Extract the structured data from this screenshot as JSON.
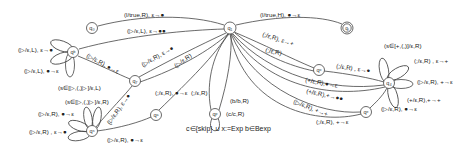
{
  "diagram": {
    "type": "pushdown-automaton",
    "states": [
      {
        "id": "q0",
        "label": "q₀",
        "x": 92,
        "y": 28
      },
      {
        "id": "q1",
        "label": "q₁",
        "x": 230,
        "y": 28
      },
      {
        "id": "qf",
        "label": "q_f",
        "x": 347,
        "y": 28,
        "accepting": true
      },
      {
        "id": "qb",
        "label": "q_b",
        "x": 73,
        "y": 52
      },
      {
        "id": "q7",
        "label": "q₇",
        "x": 135,
        "y": 81
      },
      {
        "id": "qs",
        "label": "q_s",
        "x": 92,
        "y": 131
      },
      {
        "id": "qa",
        "label": "q_a",
        "x": 156,
        "y": 115
      },
      {
        "id": "qp",
        "label": "q_p",
        "x": 215,
        "y": 114
      },
      {
        "id": "qo",
        "label": "q_o",
        "x": 319,
        "y": 70
      },
      {
        "id": "q4",
        "label": "q₄",
        "x": 389,
        "y": 83
      },
      {
        "id": "qe",
        "label": "q_e",
        "x": 366,
        "y": 112
      }
    ],
    "edge_labels": {
      "q0_q1": "(l/true,R), ε→●",
      "qb_q1": "(▷/ε,L), ε→●●",
      "q1_qf": "(l/true,H), ●→ε",
      "qb_loop_1": "(▷/ε,L), ε→●",
      "qb_loop_2": "(▷/ε,L), ●→ε",
      "qb_q7": "(▷/ε,R), ●→ε",
      "q7_q1_a": "(▷/ε,R), ε→●",
      "q7_q1_b": "(▷/ε,R)",
      "q7_loop": "(s∈[▷,(,)▷]/ε,L)",
      "qs_loop_1": "(s∈[▷,(,)▷]/ε,R)",
      "qs_loop_2": "(▷/ε,R), ●→ε",
      "qs_loop_3": "(▷/ε,R) , ε→●",
      "qs_q7": "(▷/ε,R), ε→●",
      "qs_qa": "(▷/ε,R), ●→ε",
      "qa_q1": "(;/ε,R), ●→ε",
      "qp_q1": "(;/ε,R)",
      "qp_loop_b": "(b/b,R)",
      "qp_loop_c": "(c/c,R)",
      "q1_qo_a": "(;/ε,R), ε→+",
      "q1_qo_b": "(;/ε,R)",
      "qo_q4": "(;/ε,R) , ε→●",
      "q4_q1_a": "(+/ε,R),●→ε",
      "q4_q1_b": "(+/ε,R),+→●●",
      "q4_loop_1": "(s∈[+,(,)]/ε,R)",
      "q4_loop_2": "(;/ε,R) , ε→+",
      "q4_loop_3": "(▷/ε,R), +→ε",
      "q4_loop_4": "(+/ε,R),+→+",
      "q4_qe": "(▷/ε,R), ●→ε",
      "qe_q1_a": "(▷/ε,R), +→+",
      "qe_q1_b": "(;/ε,R), +→ε"
    },
    "caption": "c∈{skip} ∪ x:=Exp  b∈Bexp"
  }
}
